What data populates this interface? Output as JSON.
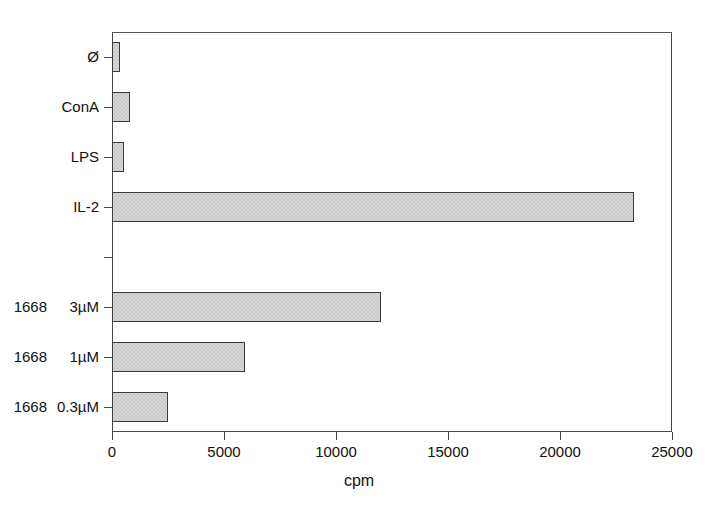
{
  "chart_data": {
    "type": "bar",
    "orientation": "horizontal",
    "title": "",
    "subtitle": "",
    "xlabel": "cpm",
    "ylabel": "",
    "xlim": [
      0,
      25000
    ],
    "xticks": [
      0,
      5000,
      10000,
      15000,
      20000,
      25000
    ],
    "xtick_labels": [
      "0",
      "5000",
      "10000",
      "15000",
      "20000",
      "25000"
    ],
    "grid": false,
    "legend": null,
    "categories": [
      "Ø",
      "ConA",
      "LPS",
      "IL-2",
      "",
      "1668 3µM",
      "1668 1µM",
      "1668 0.3µM"
    ],
    "values": [
      350,
      800,
      530,
      23300,
      null,
      12000,
      5950,
      2500
    ],
    "bars": [
      {
        "name": "Ø",
        "dose": "",
        "value": 350,
        "visible": true
      },
      {
        "name": "ConA",
        "dose": "",
        "value": 800,
        "visible": true
      },
      {
        "name": "LPS",
        "dose": "",
        "value": 530,
        "visible": true
      },
      {
        "name": "IL-2",
        "dose": "",
        "value": 23300,
        "visible": true
      },
      {
        "name": "",
        "dose": "",
        "value": null,
        "visible": false
      },
      {
        "name": "1668",
        "dose": "3µM",
        "value": 12000,
        "visible": true
      },
      {
        "name": "1668",
        "dose": "1µM",
        "value": 5950,
        "visible": true
      },
      {
        "name": "1668",
        "dose": "0.3µM",
        "value": 2500,
        "visible": true
      }
    ],
    "bar_fill_color": "#c9c9c9",
    "bar_edge_color": "#3c3c3c",
    "axis_color": "#4a4a4a",
    "background_color": "#ffffff"
  }
}
